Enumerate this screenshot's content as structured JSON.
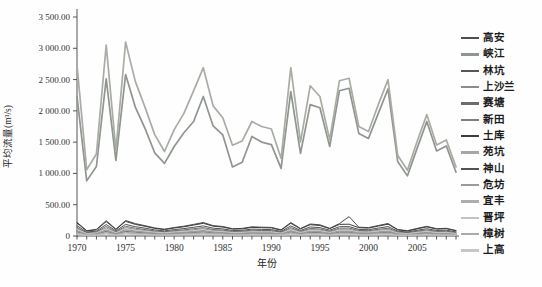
{
  "figure": {
    "background": "#fefefe",
    "axis_color": "#555555",
    "tick_label_color": "#333333"
  },
  "chart_data": {
    "type": "line",
    "title": "",
    "xlabel": "年份",
    "ylabel": "平均流量(m³/s)",
    "x": [
      1970,
      1971,
      1972,
      1973,
      1974,
      1975,
      1976,
      1977,
      1978,
      1979,
      1980,
      1981,
      1982,
      1983,
      1984,
      1985,
      1986,
      1987,
      1988,
      1989,
      1990,
      1991,
      1992,
      1993,
      1994,
      1995,
      1996,
      1997,
      1998,
      1999,
      2000,
      2001,
      2002,
      2003,
      2004,
      2005,
      2006,
      2007,
      2008,
      2009
    ],
    "x_ticks": [
      {
        "value": 1970,
        "label": "1970"
      },
      {
        "value": 1975,
        "label": "1975"
      },
      {
        "value": 1980,
        "label": "1980"
      },
      {
        "value": 1985,
        "label": "1985"
      },
      {
        "value": 1990,
        "label": "1990"
      },
      {
        "value": 1995,
        "label": "1995"
      },
      {
        "value": 2000,
        "label": "2000"
      },
      {
        "value": 2005,
        "label": "2005"
      }
    ],
    "y_ticks": [
      {
        "value": 0,
        "label": "0"
      },
      {
        "value": 500,
        "label": "500.00"
      },
      {
        "value": 1000,
        "label": "1 000.00"
      },
      {
        "value": 1500,
        "label": "1 500.00"
      },
      {
        "value": 2000,
        "label": "2 000.00"
      },
      {
        "value": 2500,
        "label": "2 500.00"
      },
      {
        "value": 3000,
        "label": "3 000.00"
      },
      {
        "value": 3500,
        "label": "3 500.00"
      }
    ],
    "ylim": [
      0,
      3500
    ],
    "grid": false,
    "legend_position": "right",
    "series": [
      {
        "name": "高安",
        "color": "#4d4d4d",
        "lw": 1.0,
        "values": [
          219,
          85,
          106,
          245,
          110,
          248,
          198,
          165,
          130,
          109,
          136,
          157,
          186,
          216,
          166,
          152,
          117,
          122,
          147,
          141,
          138,
          99,
          216,
          120,
          192,
          179,
          123,
          198,
          310,
          141,
          134,
          168,
          200,
          104,
          85,
          122,
          155,
          117,
          123,
          88
        ]
      },
      {
        "name": "峡江",
        "color": "#8f958f",
        "lw": 1.7,
        "values": [
          2230,
          880,
          1110,
          2510,
          1210,
          2580,
          2060,
          1720,
          1330,
          1160,
          1430,
          1650,
          1830,
          2230,
          1760,
          1615,
          1105,
          1180,
          1590,
          1500,
          1460,
          1080,
          2310,
          1320,
          2100,
          2050,
          1430,
          2320,
          2360,
          1640,
          1560,
          1960,
          2350,
          1190,
          960,
          1400,
          1830,
          1360,
          1440,
          1020
        ]
      },
      {
        "name": "林坑",
        "color": "#565656",
        "lw": 1.0,
        "values": [
          66,
          25,
          32,
          73,
          33,
          74,
          60,
          49,
          39,
          33,
          41,
          47,
          56,
          65,
          50,
          46,
          35,
          36,
          44,
          42,
          41,
          30,
          65,
          36,
          58,
          54,
          37,
          60,
          60,
          42,
          40,
          50,
          60,
          31,
          25,
          36,
          47,
          35,
          37,
          26
        ]
      },
      {
        "name": "上沙兰",
        "color": "#8c8c8c",
        "lw": 1.0,
        "values": [
          116,
          45,
          56,
          130,
          59,
          132,
          105,
          88,
          69,
          58,
          72,
          83,
          99,
          115,
          88,
          81,
          62,
          65,
          78,
          75,
          73,
          53,
          115,
          64,
          102,
          95,
          65,
          105,
          107,
          75,
          71,
          89,
          106,
          55,
          45,
          65,
          82,
          62,
          65,
          47
        ]
      },
      {
        "name": "赛塘",
        "color": "#6b6b6b",
        "lw": 1.0,
        "values": [
          137,
          53,
          66,
          153,
          69,
          155,
          124,
          103,
          81,
          68,
          85,
          98,
          116,
          135,
          104,
          95,
          73,
          76,
          92,
          88,
          86,
          62,
          135,
          75,
          120,
          112,
          77,
          124,
          126,
          88,
          84,
          105,
          125,
          65,
          53,
          76,
          97,
          73,
          77,
          55
        ]
      },
      {
        "name": "新田",
        "color": "#808080",
        "lw": 1.0,
        "values": [
          89,
          34,
          43,
          99,
          45,
          101,
          81,
          67,
          53,
          44,
          55,
          64,
          75,
          88,
          68,
          62,
          47,
          49,
          60,
          57,
          56,
          40,
          88,
          49,
          78,
          73,
          50,
          81,
          82,
          57,
          55,
          68,
          81,
          42,
          34,
          49,
          63,
          47,
          50,
          36
        ]
      },
      {
        "name": "土库",
        "color": "#3d3d3d",
        "lw": 1.0,
        "values": [
          206,
          80,
          99,
          230,
          104,
          233,
          186,
          155,
          122,
          102,
          128,
          147,
          174,
          203,
          156,
          143,
          110,
          114,
          138,
          132,
          129,
          93,
          203,
          113,
          180,
          168,
          116,
          186,
          189,
          132,
          126,
          158,
          188,
          98,
          80,
          114,
          146,
          110,
          116,
          83
        ]
      },
      {
        "name": "苑坑",
        "color": "#a6a6a6",
        "lw": 1.0,
        "values": [
          52,
          20,
          25,
          58,
          26,
          59,
          47,
          39,
          31,
          26,
          32,
          37,
          44,
          51,
          40,
          36,
          28,
          29,
          35,
          33,
          33,
          24,
          51,
          29,
          46,
          43,
          29,
          47,
          48,
          33,
          32,
          40,
          48,
          25,
          20,
          29,
          37,
          28,
          29,
          21
        ]
      },
      {
        "name": "神山",
        "color": "#525252",
        "lw": 1.0,
        "values": [
          164,
          64,
          79,
          184,
          83,
          186,
          149,
          124,
          97,
          82,
          102,
          118,
          139,
          162,
          125,
          114,
          88,
          91,
          110,
          106,
          103,
          74,
          162,
          90,
          144,
          134,
          92,
          149,
          151,
          106,
          101,
          126,
          150,
          78,
          64,
          91,
          116,
          88,
          92,
          66
        ]
      },
      {
        "name": "危坊",
        "color": "#9a9a9a",
        "lw": 1.0,
        "values": [
          75,
          29,
          36,
          84,
          38,
          85,
          68,
          57,
          45,
          37,
          47,
          54,
          64,
          74,
          57,
          52,
          40,
          42,
          51,
          48,
          47,
          34,
          74,
          41,
          66,
          62,
          42,
          68,
          69,
          48,
          46,
          58,
          69,
          36,
          29,
          42,
          53,
          40,
          42,
          30
        ]
      },
      {
        "name": "宜丰",
        "color": "#adadad",
        "lw": 1.0,
        "values": [
          41,
          16,
          20,
          46,
          21,
          47,
          37,
          31,
          24,
          20,
          26,
          29,
          35,
          41,
          31,
          29,
          22,
          23,
          28,
          26,
          26,
          19,
          41,
          23,
          36,
          34,
          23,
          37,
          38,
          26,
          25,
          32,
          38,
          20,
          16,
          23,
          29,
          22,
          23,
          17
        ]
      },
      {
        "name": "晋坪",
        "color": "#c2c2c2",
        "lw": 1.0,
        "values": [
          27,
          11,
          13,
          31,
          14,
          31,
          25,
          21,
          16,
          14,
          17,
          20,
          23,
          27,
          21,
          19,
          15,
          15,
          18,
          18,
          17,
          12,
          27,
          15,
          24,
          22,
          15,
          25,
          25,
          18,
          17,
          21,
          25,
          13,
          11,
          15,
          19,
          15,
          15,
          11
        ]
      },
      {
        "name": "樟树",
        "color": "#a9aca4",
        "lw": 1.7,
        "values": [
          2730,
          1060,
          1310,
          3050,
          1370,
          3100,
          2470,
          2060,
          1620,
          1350,
          1700,
          1960,
          2320,
          2690,
          2080,
          1890,
          1450,
          1520,
          1830,
          1750,
          1710,
          1240,
          2690,
          1500,
          2400,
          2230,
          1540,
          2480,
          2520,
          1750,
          1670,
          2100,
          2500,
          1290,
          1050,
          1510,
          1940,
          1455,
          1535,
          1105
        ]
      },
      {
        "name": "上高",
        "color": "#c6c6c6",
        "lw": 1.0,
        "values": [
          103,
          40,
          50,
          115,
          52,
          116,
          93,
          77,
          61,
          51,
          64,
          74,
          87,
          101,
          78,
          71,
          55,
          57,
          69,
          66,
          65,
          47,
          101,
          56,
          90,
          84,
          58,
          93,
          95,
          66,
          63,
          79,
          94,
          49,
          40,
          57,
          73,
          55,
          58,
          41
        ]
      }
    ]
  }
}
